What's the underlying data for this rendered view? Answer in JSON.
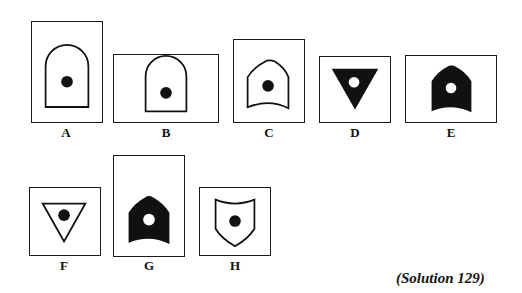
{
  "figures": [
    {
      "label": "A",
      "shape": "arch",
      "fill": "outline",
      "dot": "black"
    },
    {
      "label": "B",
      "shape": "arch",
      "fill": "outline",
      "dot": "black"
    },
    {
      "label": "C",
      "shape": "pointed-arch-curved-base",
      "fill": "outline",
      "dot": "black"
    },
    {
      "label": "D",
      "shape": "inverted-triangle",
      "fill": "solid",
      "dot": "white"
    },
    {
      "label": "E",
      "shape": "pointed-arch-curved-base",
      "fill": "solid",
      "dot": "white"
    },
    {
      "label": "F",
      "shape": "inverted-triangle",
      "fill": "outline",
      "dot": "black"
    },
    {
      "label": "G",
      "shape": "pointed-arch-curved-base",
      "fill": "solid",
      "dot": "white"
    },
    {
      "label": "H",
      "shape": "shield",
      "fill": "outline",
      "dot": "black"
    }
  ],
  "caption": "(Solution 129)",
  "colors": {
    "ink": "#111111",
    "paper": "#ffffff"
  }
}
